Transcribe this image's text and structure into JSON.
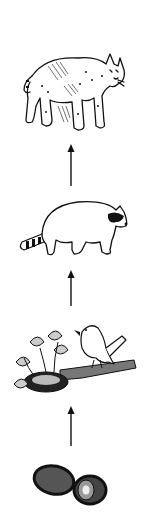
{
  "diagram": {
    "type": "food-chain",
    "direction": "bottom-to-top",
    "nodes": [
      {
        "id": "fruit",
        "label": "fruit",
        "icon": "fruit-icon"
      },
      {
        "id": "bird",
        "label": "bird",
        "icon": "bird-icon"
      },
      {
        "id": "raccoon",
        "label": "raccoon",
        "icon": "raccoon-icon"
      },
      {
        "id": "bobcat",
        "label": "bobcat",
        "icon": "bobcat-icon"
      }
    ],
    "edges": [
      {
        "from": "fruit",
        "to": "bird"
      },
      {
        "from": "bird",
        "to": "raccoon"
      },
      {
        "from": "raccoon",
        "to": "bobcat"
      }
    ],
    "colors": {
      "line": "#111111",
      "background": "#ffffff"
    }
  }
}
